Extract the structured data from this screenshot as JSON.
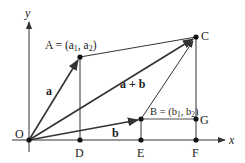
{
  "diagram": {
    "axes": {
      "x_label": "x",
      "y_label": "y"
    },
    "points": {
      "O": {
        "label": "O"
      },
      "A": {
        "label": "A = (a",
        "sub1": "1",
        "mid": ", a",
        "sub2": "2",
        "end": ")"
      },
      "B": {
        "label": "B = (b",
        "sub1": "1",
        "mid": ", b",
        "sub2": "2",
        "end": ")"
      },
      "C": {
        "label": "C"
      },
      "D": {
        "label": "D"
      },
      "E": {
        "label": "E"
      },
      "F": {
        "label": "F"
      },
      "G": {
        "label": "G"
      }
    },
    "vectors": {
      "a": "a",
      "b": "b",
      "sum": "a + b"
    },
    "colors": {
      "line": "#333333",
      "helper_line": "#888888",
      "point": "#111111"
    }
  }
}
